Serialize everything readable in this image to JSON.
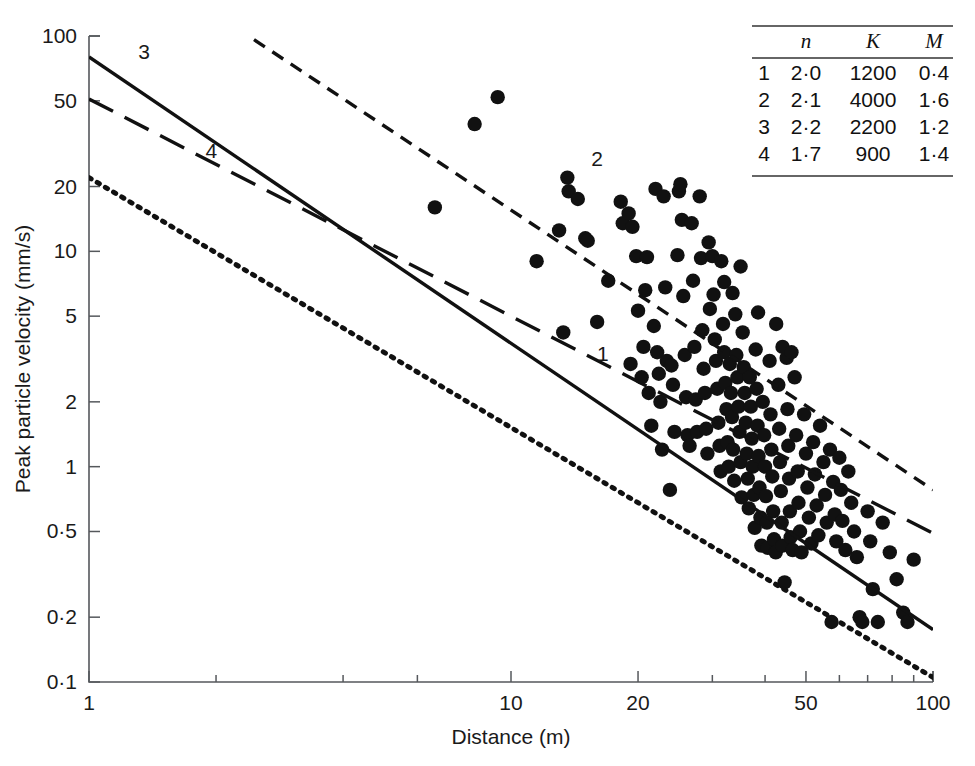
{
  "chart_data": {
    "type": "scatter",
    "title": "",
    "xlabel": "Distance (m)",
    "ylabel": "Peak particle velocity (mm/s)",
    "xscale": "log",
    "yscale": "log",
    "xlim": [
      1,
      100
    ],
    "ylim": [
      0.1,
      100
    ],
    "grid": false,
    "legend": "none",
    "xticks": [
      1,
      10,
      20,
      50,
      100
    ],
    "xticklabels": [
      "1",
      "10",
      "20",
      "50",
      "100"
    ],
    "xminorticks": [
      2,
      4,
      6,
      30,
      40,
      60,
      70,
      80,
      90
    ],
    "yticks": [
      0.1,
      0.2,
      0.5,
      1,
      2,
      5,
      10,
      20,
      50,
      100
    ],
    "yticklabels": [
      "0·1",
      "0·2",
      "0·5",
      "1",
      "2",
      "5",
      "10",
      "20",
      "50",
      "100"
    ],
    "series": [
      {
        "name": "measurements",
        "type": "scatter",
        "marker": "filled-circle",
        "color": "#111111",
        "points": [
          [
            6.6,
            16.0
          ],
          [
            8.2,
            39.0
          ],
          [
            9.3,
            52.0
          ],
          [
            11.5,
            9.0
          ],
          [
            13.0,
            12.5
          ],
          [
            13.3,
            4.2
          ],
          [
            13.6,
            22.0
          ],
          [
            13.7,
            19.0
          ],
          [
            14.4,
            17.5
          ],
          [
            15.0,
            11.5
          ],
          [
            15.2,
            11.2
          ],
          [
            16.0,
            4.7
          ],
          [
            17.0,
            7.3
          ],
          [
            18.2,
            17.0
          ],
          [
            18.4,
            13.5
          ],
          [
            19.0,
            15.0
          ],
          [
            19.4,
            13.0
          ],
          [
            19.2,
            3.0
          ],
          [
            19.8,
            9.5
          ],
          [
            20.0,
            5.3
          ],
          [
            20.4,
            2.6
          ],
          [
            20.6,
            3.6
          ],
          [
            20.8,
            6.6
          ],
          [
            21.0,
            9.4
          ],
          [
            21.2,
            2.2
          ],
          [
            21.5,
            1.55
          ],
          [
            21.8,
            4.5
          ],
          [
            22.0,
            19.5
          ],
          [
            22.2,
            3.4
          ],
          [
            22.4,
            2.7
          ],
          [
            22.6,
            2.0
          ],
          [
            22.8,
            1.2
          ],
          [
            23.0,
            18.0
          ],
          [
            23.2,
            6.8
          ],
          [
            23.4,
            3.1
          ],
          [
            23.8,
            0.78
          ],
          [
            24.0,
            2.95
          ],
          [
            24.2,
            2.4
          ],
          [
            24.4,
            1.45
          ],
          [
            24.8,
            9.6
          ],
          [
            25.0,
            19.0
          ],
          [
            25.2,
            20.5
          ],
          [
            25.4,
            14.0
          ],
          [
            25.6,
            6.2
          ],
          [
            25.8,
            3.3
          ],
          [
            26.0,
            2.1
          ],
          [
            26.2,
            1.4
          ],
          [
            26.5,
            1.25
          ],
          [
            27.0,
            7.3
          ],
          [
            27.2,
            3.6
          ],
          [
            27.4,
            2.05
          ],
          [
            27.6,
            1.45
          ],
          [
            28.0,
            18.0
          ],
          [
            28.2,
            9.3
          ],
          [
            28.4,
            4.3
          ],
          [
            28.6,
            2.85
          ],
          [
            28.8,
            2.2
          ],
          [
            29.0,
            1.5
          ],
          [
            29.2,
            1.15
          ],
          [
            29.6,
            5.4
          ],
          [
            30.0,
            9.5
          ],
          [
            30.2,
            6.3
          ],
          [
            30.4,
            3.9
          ],
          [
            30.6,
            3.1
          ],
          [
            30.8,
            2.3
          ],
          [
            31.0,
            1.6
          ],
          [
            31.2,
            1.25
          ],
          [
            31.4,
            0.95
          ],
          [
            31.8,
            4.6
          ],
          [
            32.0,
            3.4
          ],
          [
            32.2,
            2.45
          ],
          [
            32.4,
            1.85
          ],
          [
            32.6,
            1.3
          ],
          [
            32.8,
            1.0
          ],
          [
            33.0,
            3.0
          ],
          [
            33.2,
            2.2
          ],
          [
            33.4,
            1.7
          ],
          [
            33.6,
            1.2
          ],
          [
            33.8,
            0.86
          ],
          [
            34.0,
            5.1
          ],
          [
            34.2,
            3.3
          ],
          [
            34.4,
            2.6
          ],
          [
            34.6,
            1.9
          ],
          [
            34.8,
            1.45
          ],
          [
            35.0,
            1.05
          ],
          [
            35.2,
            0.72
          ],
          [
            35.4,
            4.2
          ],
          [
            35.6,
            2.9
          ],
          [
            35.8,
            2.2
          ],
          [
            36.0,
            1.6
          ],
          [
            36.2,
            1.15
          ],
          [
            36.4,
            0.88
          ],
          [
            36.6,
            0.64
          ],
          [
            36.8,
            2.6
          ],
          [
            37.0,
            1.9
          ],
          [
            37.2,
            1.35
          ],
          [
            37.4,
            1.0
          ],
          [
            37.6,
            0.74
          ],
          [
            37.8,
            0.52
          ],
          [
            38.0,
            3.5
          ],
          [
            38.2,
            2.3
          ],
          [
            38.4,
            1.55
          ],
          [
            38.6,
            1.12
          ],
          [
            38.8,
            0.8
          ],
          [
            39.0,
            0.58
          ],
          [
            39.2,
            0.43
          ],
          [
            39.5,
            2.0
          ],
          [
            39.8,
            1.4
          ],
          [
            40.0,
            1.0
          ],
          [
            40.2,
            0.73
          ],
          [
            40.4,
            0.55
          ],
          [
            40.6,
            0.42
          ],
          [
            41.0,
            3.1
          ],
          [
            41.2,
            1.75
          ],
          [
            41.4,
            1.2
          ],
          [
            41.6,
            0.9
          ],
          [
            41.8,
            0.62
          ],
          [
            42.0,
            0.46
          ],
          [
            42.4,
            0.4
          ],
          [
            43.0,
            2.4
          ],
          [
            43.2,
            1.5
          ],
          [
            43.4,
            1.05
          ],
          [
            43.6,
            0.77
          ],
          [
            43.8,
            0.55
          ],
          [
            44.0,
            0.43
          ],
          [
            44.5,
            0.29
          ],
          [
            45.0,
            3.2
          ],
          [
            45.2,
            1.85
          ],
          [
            45.4,
            1.25
          ],
          [
            45.6,
            0.88
          ],
          [
            45.8,
            0.62
          ],
          [
            46.0,
            0.47
          ],
          [
            46.5,
            0.41
          ],
          [
            47.0,
            2.6
          ],
          [
            47.4,
            1.4
          ],
          [
            47.8,
            0.95
          ],
          [
            48.0,
            0.68
          ],
          [
            48.4,
            0.5
          ],
          [
            48.8,
            0.4
          ],
          [
            49.5,
            1.75
          ],
          [
            50.0,
            1.15
          ],
          [
            50.4,
            0.8
          ],
          [
            50.8,
            0.58
          ],
          [
            51.5,
            0.44
          ],
          [
            52.0,
            1.3
          ],
          [
            52.5,
            0.92
          ],
          [
            53.0,
            0.66
          ],
          [
            53.5,
            0.48
          ],
          [
            54.0,
            1.55
          ],
          [
            55.0,
            1.05
          ],
          [
            55.5,
            0.74
          ],
          [
            56.0,
            0.55
          ],
          [
            57.0,
            1.2
          ],
          [
            58.0,
            0.85
          ],
          [
            58.5,
            0.6
          ],
          [
            59.0,
            0.45
          ],
          [
            60.0,
            1.1
          ],
          [
            60.5,
            0.78
          ],
          [
            61.0,
            0.56
          ],
          [
            62.0,
            0.41
          ],
          [
            63.0,
            0.95
          ],
          [
            64.0,
            0.68
          ],
          [
            65.0,
            0.5
          ],
          [
            66.0,
            0.38
          ],
          [
            67.0,
            0.2
          ],
          [
            68.0,
            0.19
          ],
          [
            70.0,
            0.62
          ],
          [
            71.0,
            0.45
          ],
          [
            72.0,
            0.27
          ],
          [
            74.0,
            0.19
          ],
          [
            76.0,
            0.55
          ],
          [
            79.0,
            0.4
          ],
          [
            82.0,
            0.3
          ],
          [
            85.0,
            0.21
          ],
          [
            87.0,
            0.19
          ],
          [
            90.0,
            0.37
          ],
          [
            57.5,
            0.19
          ],
          [
            44.0,
            3.6
          ],
          [
            46.2,
            3.4
          ],
          [
            38.5,
            5.2
          ],
          [
            42.5,
            4.6
          ],
          [
            35.0,
            8.5
          ],
          [
            32.0,
            7.2
          ],
          [
            29.4,
            11.0
          ],
          [
            26.8,
            13.5
          ],
          [
            31.5,
            9.0
          ],
          [
            33.5,
            6.4
          ]
        ]
      }
    ],
    "fit_lines": [
      {
        "id": "1",
        "label": "1",
        "style": "dotted",
        "n": "2·0",
        "K": "1200",
        "M": "0·4",
        "x0": 1,
        "y0": 22.0,
        "x1": 100,
        "y1": 0.105,
        "label_x": 16.5,
        "label_y": 3.1
      },
      {
        "id": "2",
        "label": "2",
        "style": "short-dash",
        "n": "2·1",
        "K": "4000",
        "M": "1·6",
        "x0": 1,
        "y0": 310.0,
        "x1": 100,
        "y1": 0.78,
        "label_x": 16.0,
        "label_y": 25.0
      },
      {
        "id": "3",
        "label": "3",
        "style": "solid",
        "n": "2·2",
        "K": "2200",
        "M": "1·2",
        "x0": 1,
        "y0": 80.0,
        "x1": 100,
        "y1": 0.175,
        "label_x": 1.35,
        "label_y": 78.0
      },
      {
        "id": "4",
        "label": "4",
        "style": "long-dash",
        "n": "1·7",
        "K": "900",
        "M": "1·4",
        "x0": 1,
        "y0": 51.0,
        "x1": 100,
        "y1": 0.49,
        "label_x": 1.95,
        "label_y": 27.0
      }
    ]
  },
  "table": {
    "name": "parameter-table",
    "columns": [
      "",
      "n",
      "K",
      "M"
    ],
    "rows": [
      {
        "curve": "1",
        "n": "2·0",
        "K": "1200",
        "M": "0·4"
      },
      {
        "curve": "2",
        "n": "2·1",
        "K": "4000",
        "M": "1·6"
      },
      {
        "curve": "3",
        "n": "2·2",
        "K": "2200",
        "M": "1·2"
      },
      {
        "curve": "4",
        "n": "1·7",
        "K": "900",
        "M": "1·4"
      }
    ]
  },
  "colors": {
    "ink": "#111111",
    "axis": "#55585c",
    "background": "#ffffff"
  }
}
